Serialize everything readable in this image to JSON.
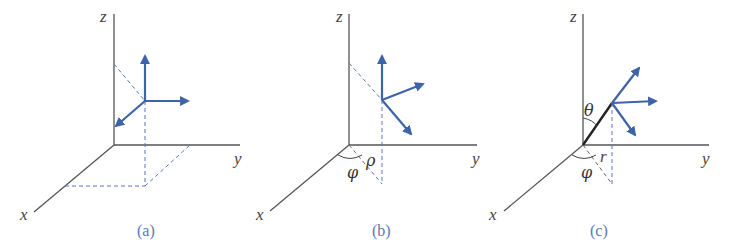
{
  "figure": {
    "colors": {
      "axes": "#555555",
      "vectors": "#3d63a8",
      "dashed": "#5a78b8",
      "caption": "#5a78b8"
    },
    "panels": [
      {
        "caption": "(a)",
        "axis_labels": {
          "x": "x",
          "y": "y",
          "z": "z"
        },
        "coordinate_system": "cartesian"
      },
      {
        "caption": "(b)",
        "axis_labels": {
          "x": "x",
          "y": "y",
          "z": "z"
        },
        "angle_labels": {
          "phi": "φ",
          "rho": "ρ"
        },
        "coordinate_system": "cylindrical"
      },
      {
        "caption": "(c)",
        "axis_labels": {
          "x": "x",
          "y": "y",
          "z": "z"
        },
        "angle_labels": {
          "phi": "φ",
          "theta": "θ",
          "r": "r"
        },
        "coordinate_system": "spherical"
      }
    ]
  }
}
